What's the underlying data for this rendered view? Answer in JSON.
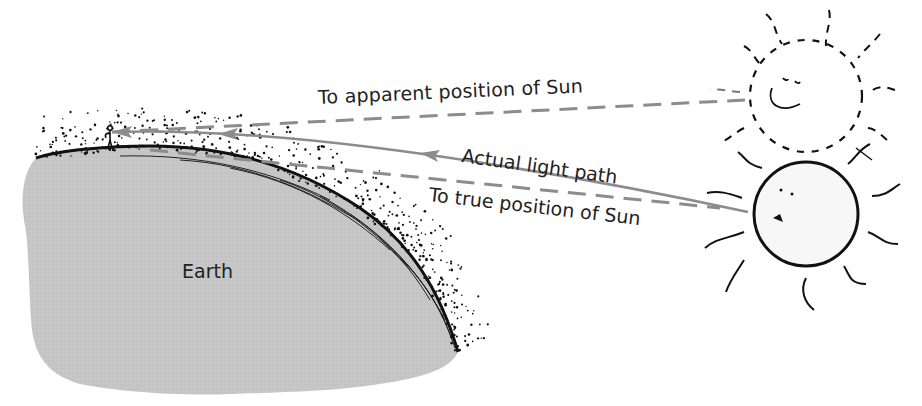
{
  "diagram": {
    "labels": {
      "apparent_sun": "To apparent position of Sun",
      "actual_path": "Actual light path",
      "true_sun": "To true position of Sun",
      "earth": "Earth"
    },
    "elements": [
      {
        "id": "earth",
        "type": "landmass",
        "label": "Earth"
      },
      {
        "id": "atmosphere",
        "type": "stipple-layer"
      },
      {
        "id": "observer",
        "type": "stick-figure"
      },
      {
        "id": "apparent-sun",
        "type": "dashed-sun"
      },
      {
        "id": "true-sun",
        "type": "solid-sun"
      },
      {
        "id": "apparent-line",
        "type": "dashed-line",
        "label": "To apparent position of Sun"
      },
      {
        "id": "actual-path",
        "type": "curved-arrow",
        "label": "Actual light path"
      },
      {
        "id": "true-line",
        "type": "dashed-line",
        "label": "To true position of Sun"
      }
    ],
    "colors": {
      "earth_fill": "#c4c4c4",
      "line_gray": "#8c8c8c",
      "ink": "#111111",
      "sun_fill": "#f7f7f7"
    }
  }
}
